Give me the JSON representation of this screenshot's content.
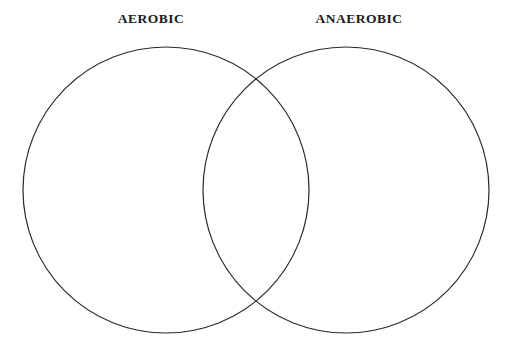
{
  "diagram": {
    "type": "venn-2-set",
    "background_color": "#ffffff",
    "stroke_color": "#2a2a2a",
    "stroke_width": 1.2,
    "fill": "none",
    "labels": {
      "left": "AEROBIC",
      "right": "ANAEROBIC"
    },
    "label_color": "#1a1a1a",
    "sets": [
      {
        "name": "AEROBIC",
        "side": "left",
        "center_x": 166,
        "center_y": 190,
        "radius": 143,
        "items": []
      },
      {
        "name": "ANAEROBIC",
        "side": "right",
        "center_x": 346,
        "center_y": 190,
        "radius": 143,
        "items": []
      }
    ],
    "intersection": {
      "name": "AEROBIC and ANAEROBIC",
      "items": []
    }
  }
}
